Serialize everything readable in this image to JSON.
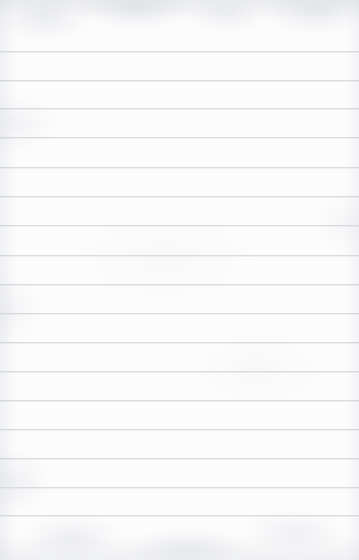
{
  "document": {
    "kind": "lined-paper-page",
    "title": "",
    "body_text": "",
    "page_width": 359,
    "page_height": 560
  },
  "paper": {
    "background_color": "#fcfcfd",
    "texture": "mottled-scanned-paper",
    "vignette": "soft-edge-darkening",
    "edge_tint_color": "#bec3c8"
  },
  "ruling": {
    "line_color": "#d9dbdd",
    "line_thickness_px": 1,
    "line_spacing_px": 29,
    "first_line_y": 51,
    "left_inset_px": 0,
    "right_inset_px": 0,
    "margin_rule": "none",
    "line_count": 17,
    "line_positions": [
      51,
      80,
      108,
      137,
      167,
      196,
      225,
      255,
      284,
      313,
      342,
      371,
      400,
      429,
      458,
      487,
      515
    ],
    "lines": [
      {
        "index": 1,
        "y": 51,
        "text": ""
      },
      {
        "index": 2,
        "y": 80,
        "text": ""
      },
      {
        "index": 3,
        "y": 108,
        "text": ""
      },
      {
        "index": 4,
        "y": 137,
        "text": ""
      },
      {
        "index": 5,
        "y": 167,
        "text": ""
      },
      {
        "index": 6,
        "y": 196,
        "text": ""
      },
      {
        "index": 7,
        "y": 225,
        "text": ""
      },
      {
        "index": 8,
        "y": 255,
        "text": ""
      },
      {
        "index": 9,
        "y": 284,
        "text": ""
      },
      {
        "index": 10,
        "y": 313,
        "text": ""
      },
      {
        "index": 11,
        "y": 342,
        "text": ""
      },
      {
        "index": 12,
        "y": 371,
        "text": ""
      },
      {
        "index": 13,
        "y": 400,
        "text": ""
      },
      {
        "index": 14,
        "y": 429,
        "text": ""
      },
      {
        "index": 15,
        "y": 458,
        "text": ""
      },
      {
        "index": 16,
        "y": 487,
        "text": ""
      },
      {
        "index": 17,
        "y": 515,
        "text": ""
      }
    ]
  },
  "margins": {
    "top_blank_px": 51,
    "bottom_blank_px": 45
  }
}
